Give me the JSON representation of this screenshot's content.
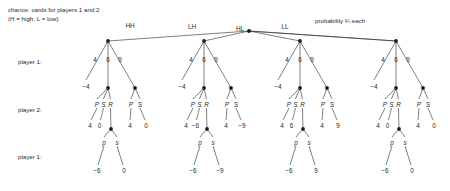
{
  "figure": {
    "caption_line1": "chance: cards for players 1 and 2",
    "caption_line2": "(H = high, L = low):",
    "probability_note": "probability ¼ each",
    "row_labels": [
      "player 1:",
      "player 2:",
      "player 1:"
    ]
  },
  "chance": {
    "branches": [
      "HH",
      "LH",
      "HL",
      "LL"
    ],
    "probability_each": "¼"
  },
  "player1_bids": [
    "4",
    "6",
    "9"
  ],
  "player1_bid4_payoff": "−4",
  "player2_actions_mid": [
    "P",
    "S",
    "R"
  ],
  "player2_actions_right": [
    "P",
    "S"
  ],
  "player1_final_actions": [
    "p",
    "s"
  ],
  "subtrees": [
    {
      "chance_label": "HH",
      "p2_mid_payoffs": [
        "4",
        "0"
      ],
      "p2_right_payoffs": [
        "4",
        "0"
      ],
      "final_payoffs": [
        "−6",
        "0"
      ]
    },
    {
      "chance_label": "LH",
      "p2_mid_payoffs": [
        "4",
        "−6"
      ],
      "p2_right_payoffs": [
        "4",
        "−9"
      ],
      "final_payoffs": [
        "−6",
        "−9"
      ]
    },
    {
      "chance_label": "HL",
      "p2_mid_payoffs": [
        "4",
        "6"
      ],
      "p2_right_payoffs": [
        "4",
        "9"
      ],
      "final_payoffs": [
        "−6",
        "9"
      ]
    },
    {
      "chance_label": "LL",
      "p2_mid_payoffs": [
        "4",
        "0"
      ],
      "p2_right_payoffs": [
        "4",
        "0"
      ],
      "final_payoffs": [
        "−6",
        "0"
      ]
    }
  ],
  "geometry": {
    "root": {
      "x": 249,
      "y": 31
    },
    "chance_label_pos": [
      {
        "x": 130,
        "y": 25
      },
      {
        "x": 192,
        "y": 26
      },
      {
        "x": 240,
        "y": 28
      },
      {
        "x": 285,
        "y": 26
      }
    ],
    "prob_note_pos": {
      "x": 345,
      "y": 21
    },
    "subtree_x": [
      108,
      204,
      300,
      396
    ],
    "p1_node_y": 41,
    "p2_node_y": 88,
    "p1b_node_y": 129,
    "bid_label_y": 59,
    "bid_dx": [
      -13,
      0,
      12
    ],
    "bid4_term": {
      "dx": -22,
      "dy": 86
    },
    "p2_mid_dx": 0,
    "p2_right_dx": 27,
    "action_label_y": 104,
    "p2_payoff_y": 125,
    "final_action_y": 142,
    "final_payoff_y": 170,
    "row_label_x": 18,
    "row_label_y": [
      62,
      110,
      157
    ]
  }
}
